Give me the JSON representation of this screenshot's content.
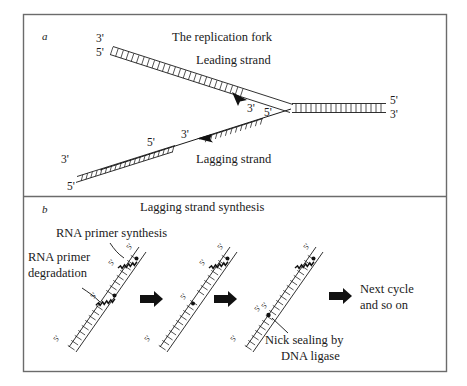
{
  "figure": {
    "background_color": "#ffffff",
    "ink_color": "#1a1a1a",
    "frame_color": "#6b6b6b"
  },
  "panel_a": {
    "letter": "a",
    "title": "The replication fork",
    "labels": {
      "leading_strand": "Leading strand",
      "lagging_strand": "Lagging strand"
    },
    "primes": {
      "top_left_upper": "3'",
      "top_left_lower": "5'",
      "leading_arrow_end": "3'",
      "right_upper": "5'",
      "right_lower": "3'",
      "lagging_fragment_new_5": "5'",
      "lagging_fragment_new_3": "3'",
      "lagging_mid_5": "5'",
      "bottom_left_upper": "3'",
      "bottom_left_lower": "5'"
    }
  },
  "panel_b": {
    "letter": "b",
    "title": "Lagging strand synthesis",
    "labels": {
      "rna_primer_synthesis": "RNA primer synthesis",
      "rna_primer_degradation_line1": "RNA primer",
      "rna_primer_degradation_line2": "degradation",
      "nick_sealing_line1": "Nick sealing by",
      "nick_sealing_line2": "DNA ligase",
      "next_cycle_line1": "Next cycle",
      "next_cycle_line2": "and so on"
    },
    "stages": [
      {
        "name": "stage-1-primer-synthesis-and-degradation",
        "primes": [
          "5'",
          "5'",
          "5'",
          "5'"
        ]
      },
      {
        "name": "stage-2-gap-filling",
        "primes": [
          "5'",
          "5'",
          "5'",
          "5'"
        ]
      },
      {
        "name": "stage-3-nick-sealing",
        "primes": [
          "5'",
          "5'",
          "5'",
          "5'"
        ]
      }
    ],
    "arrow_count": 3
  }
}
